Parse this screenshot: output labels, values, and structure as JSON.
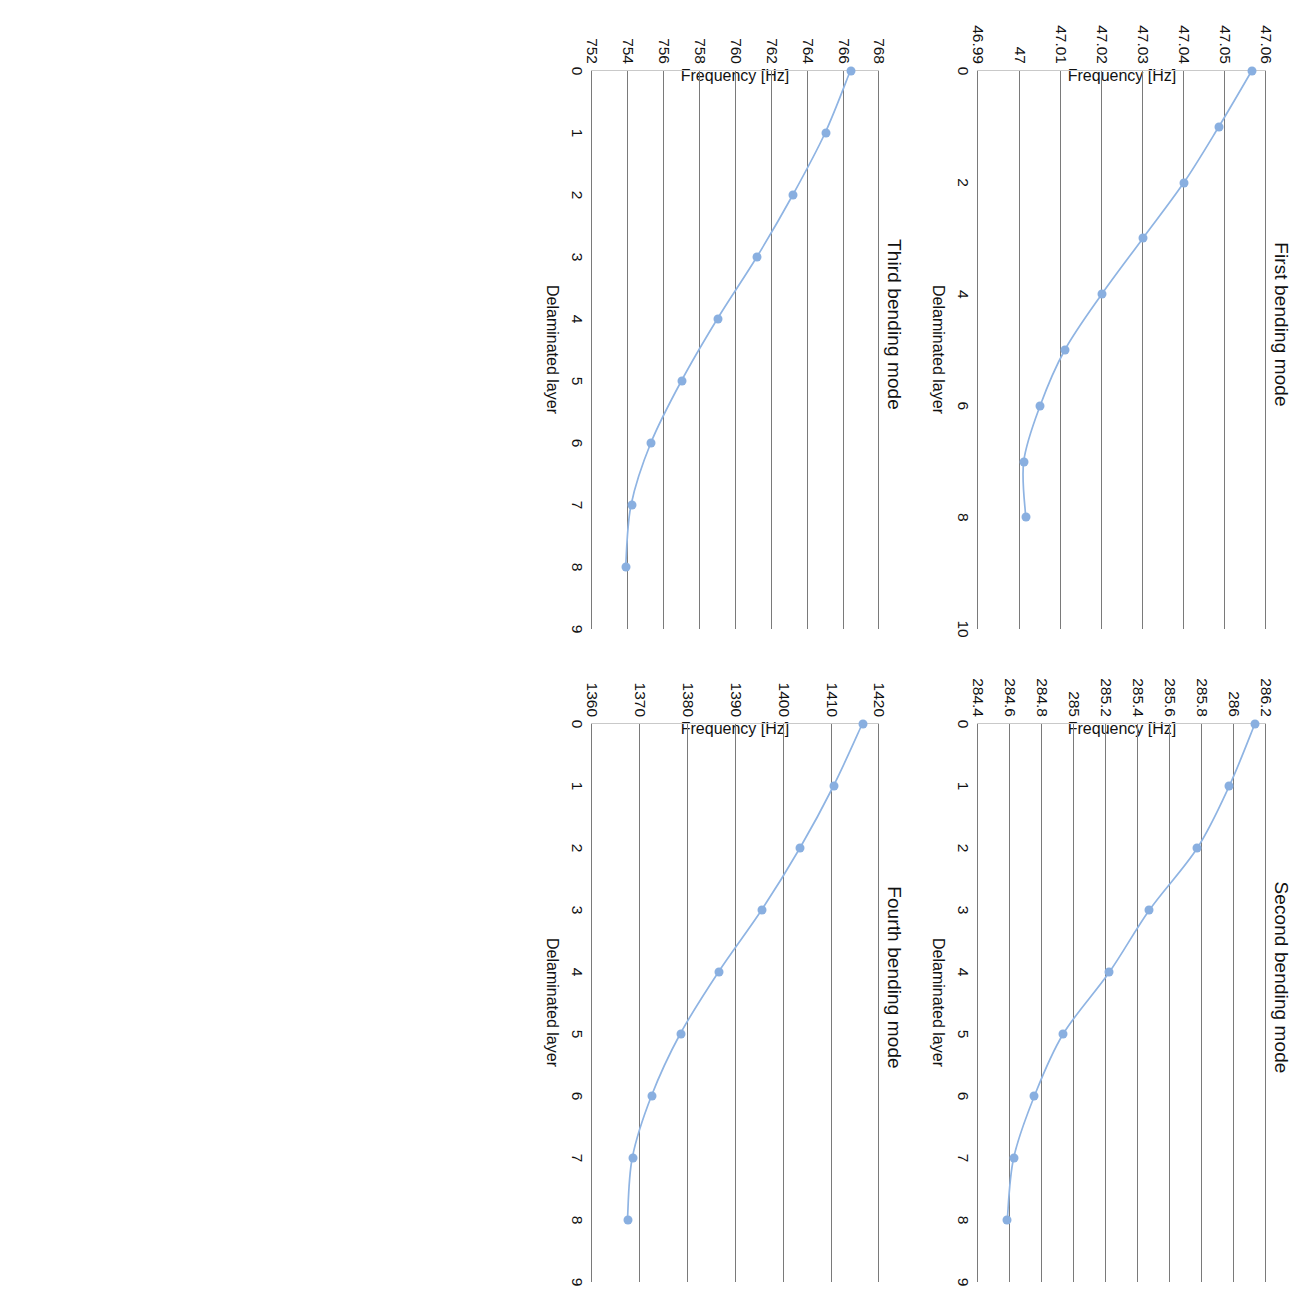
{
  "figure": {
    "axis_x_label": "Delaminated layer",
    "axis_y_label": "Frequency [Hz]",
    "marker_color": "#89AFE0",
    "line_color": "#8FB4E3",
    "gridline_color": "#7a7a7a"
  },
  "chart_data": [
    {
      "type": "line",
      "title": "First bending mode",
      "xlabel": "Delaminated layer",
      "ylabel": "Frequency [Hz]",
      "x": [
        0,
        1,
        2,
        3,
        4,
        5,
        6,
        7,
        8
      ],
      "values": [
        47.0565,
        47.0485,
        47.04,
        47.03,
        47.02,
        47.011,
        47.005,
        47.001,
        47.0015
      ],
      "xticks": [
        "0",
        "2",
        "4",
        "6",
        "8",
        "10"
      ],
      "xtick_values": [
        0,
        2,
        4,
        6,
        8,
        10
      ],
      "yticks": [
        "47.06",
        "47.05",
        "47.04",
        "47.03",
        "47.02",
        "47.01",
        "47",
        "46.99"
      ],
      "ytick_values": [
        47.06,
        47.05,
        47.04,
        47.03,
        47.02,
        47.01,
        47.0,
        46.99
      ],
      "xlim": [
        0,
        10
      ],
      "ylim": [
        46.99,
        47.06
      ],
      "y_axis_inverted": true,
      "grid": true,
      "legend": false
    },
    {
      "type": "line",
      "title": "Second bending mode",
      "xlabel": "Delaminated layer",
      "ylabel": "Frequency [Hz]",
      "x": [
        0,
        1,
        2,
        3,
        4,
        5,
        6,
        7,
        8
      ],
      "values": [
        286.13,
        285.97,
        285.77,
        285.47,
        285.22,
        284.93,
        284.75,
        284.62,
        284.58
      ],
      "xticks": [
        "0",
        "1",
        "2",
        "3",
        "4",
        "5",
        "6",
        "7",
        "8",
        "9"
      ],
      "xtick_values": [
        0,
        1,
        2,
        3,
        4,
        5,
        6,
        7,
        8,
        9
      ],
      "yticks": [
        "286.2",
        "286",
        "285.8",
        "285.6",
        "285.4",
        "285.2",
        "285",
        "284.8",
        "284.6",
        "284.4"
      ],
      "ytick_values": [
        286.2,
        286.0,
        285.8,
        285.6,
        285.4,
        285.2,
        285.0,
        284.8,
        284.6,
        284.4
      ],
      "xlim": [
        0,
        9
      ],
      "ylim": [
        284.4,
        286.2
      ],
      "y_axis_inverted": true,
      "grid": true,
      "legend": false
    },
    {
      "type": "line",
      "title": "Third bending mode",
      "xlabel": "Delaminated layer",
      "ylabel": "Frequency [Hz]",
      "x": [
        0,
        1,
        2,
        3,
        4,
        5,
        6,
        7,
        8
      ],
      "values": [
        766.4,
        765.0,
        763.2,
        761.2,
        759.0,
        757.0,
        755.3,
        754.2,
        753.9
      ],
      "xticks": [
        "0",
        "1",
        "2",
        "3",
        "4",
        "5",
        "6",
        "7",
        "8",
        "9"
      ],
      "xtick_values": [
        0,
        1,
        2,
        3,
        4,
        5,
        6,
        7,
        8,
        9
      ],
      "yticks": [
        "768",
        "766",
        "764",
        "762",
        "760",
        "758",
        "756",
        "754",
        "752"
      ],
      "ytick_values": [
        768,
        766,
        764,
        762,
        760,
        758,
        756,
        754,
        752
      ],
      "xlim": [
        0,
        9
      ],
      "ylim": [
        752,
        768
      ],
      "y_axis_inverted": true,
      "grid": true,
      "legend": false
    },
    {
      "type": "line",
      "title": "Fourth bending mode",
      "xlabel": "Delaminated layer",
      "ylabel": "Frequency [Hz]",
      "x": [
        0,
        1,
        2,
        3,
        4,
        5,
        6,
        7,
        8
      ],
      "values": [
        1416.5,
        1410.5,
        1403.5,
        1395.5,
        1386.5,
        1378.5,
        1372.5,
        1368.5,
        1367.5
      ],
      "xticks": [
        "0",
        "1",
        "2",
        "3",
        "4",
        "5",
        "6",
        "7",
        "8",
        "9"
      ],
      "xtick_values": [
        0,
        1,
        2,
        3,
        4,
        5,
        6,
        7,
        8,
        9
      ],
      "yticks": [
        "1420",
        "1410",
        "1400",
        "1390",
        "1380",
        "1370",
        "1360"
      ],
      "ytick_values": [
        1420,
        1410,
        1400,
        1390,
        1380,
        1370,
        1360
      ],
      "xlim": [
        0,
        9
      ],
      "ylim": [
        1360,
        1420
      ],
      "y_axis_inverted": true,
      "grid": true,
      "legend": false
    }
  ]
}
